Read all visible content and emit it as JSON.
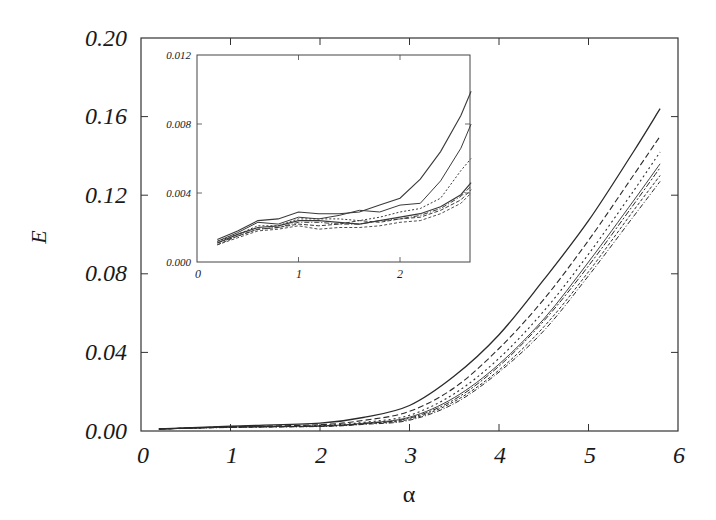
{
  "chart_data": [
    {
      "type": "line",
      "title": "",
      "xlabel": "α",
      "ylabel": "E",
      "xlim": [
        0,
        6
      ],
      "ylim": [
        0,
        0.2
      ],
      "xticks": [
        "0",
        "1",
        "2",
        "3",
        "4",
        "5",
        "6"
      ],
      "yticks": [
        "0.00",
        "0.04",
        "0.08",
        "0.12",
        "0.16",
        "0.20"
      ],
      "grid": false,
      "legend": null,
      "x": [
        0.2,
        1.0,
        2.0,
        2.5,
        3.0,
        3.5,
        4.0,
        4.5,
        5.0,
        5.5,
        5.8
      ],
      "series": [
        {
          "name": "curve-1 (solid)",
          "style": "solid",
          "values": [
            0.001,
            0.0025,
            0.004,
            0.007,
            0.013,
            0.028,
            0.049,
            0.077,
            0.107,
            0.142,
            0.164
          ]
        },
        {
          "name": "curve-2 (dashed)",
          "style": "dashed",
          "values": [
            0.001,
            0.0022,
            0.0032,
            0.0055,
            0.01,
            0.022,
            0.042,
            0.067,
            0.097,
            0.13,
            0.15
          ]
        },
        {
          "name": "curve-3 (dotted)",
          "style": "dotted",
          "values": [
            0.001,
            0.0021,
            0.0028,
            0.0045,
            0.008,
            0.019,
            0.037,
            0.061,
            0.09,
            0.122,
            0.142
          ]
        },
        {
          "name": "curve-4 (solid thin)",
          "style": "solid",
          "values": [
            0.001,
            0.002,
            0.0026,
            0.004,
            0.007,
            0.017,
            0.034,
            0.057,
            0.086,
            0.117,
            0.136
          ]
        },
        {
          "name": "curve-5 (dash-dot)",
          "style": "dashdot",
          "values": [
            0.001,
            0.002,
            0.0025,
            0.0038,
            0.0065,
            0.016,
            0.033,
            0.056,
            0.084,
            0.115,
            0.134
          ]
        },
        {
          "name": "curve-6 (dashed fine)",
          "style": "dashed",
          "values": [
            0.001,
            0.0019,
            0.0024,
            0.0036,
            0.006,
            0.015,
            0.031,
            0.053,
            0.081,
            0.112,
            0.13
          ]
        },
        {
          "name": "curve-7 (dash-dot)",
          "style": "dashdot",
          "values": [
            0.001,
            0.0018,
            0.0023,
            0.0034,
            0.0055,
            0.014,
            0.03,
            0.051,
            0.079,
            0.109,
            0.127
          ]
        }
      ]
    },
    {
      "type": "line",
      "title": "inset",
      "xlabel": "",
      "ylabel": "",
      "xlim": [
        0,
        2.7
      ],
      "ylim": [
        0,
        0.012
      ],
      "xticks": [
        "0",
        "1",
        "2"
      ],
      "yticks": [
        "0.000",
        "0.004",
        "0.008",
        "0.012"
      ],
      "grid": false,
      "x": [
        0.2,
        0.4,
        0.6,
        0.8,
        1.0,
        1.2,
        1.4,
        1.6,
        1.8,
        2.0,
        2.2,
        2.4,
        2.6,
        2.7
      ],
      "series": [
        {
          "name": "curve-1 (solid)",
          "style": "solid",
          "values": [
            0.0013,
            0.0018,
            0.0024,
            0.0025,
            0.0029,
            0.0028,
            0.0028,
            0.0029,
            0.0033,
            0.0037,
            0.0048,
            0.0064,
            0.0085,
            0.0099
          ]
        },
        {
          "name": "curve-2 (solid)",
          "style": "solid",
          "values": [
            0.0012,
            0.0017,
            0.0023,
            0.0022,
            0.0026,
            0.0025,
            0.0027,
            0.003,
            0.0029,
            0.0033,
            0.0034,
            0.0047,
            0.0066,
            0.008
          ]
        },
        {
          "name": "curve-3 (dotted)",
          "style": "dotted",
          "values": [
            0.0012,
            0.0016,
            0.0021,
            0.0021,
            0.0025,
            0.0025,
            0.0025,
            0.0024,
            0.0026,
            0.0029,
            0.0031,
            0.0037,
            0.0053,
            0.006
          ]
        },
        {
          "name": "curve-4 (solid dark)",
          "style": "solid",
          "values": [
            0.0011,
            0.0016,
            0.002,
            0.0021,
            0.0024,
            0.0024,
            0.0023,
            0.0022,
            0.0024,
            0.0026,
            0.0028,
            0.0032,
            0.0039,
            0.0046
          ]
        },
        {
          "name": "curve-5 (dash-dot)",
          "style": "dashdot",
          "values": [
            0.0011,
            0.0015,
            0.0019,
            0.002,
            0.0023,
            0.0023,
            0.0022,
            0.0022,
            0.0024,
            0.0025,
            0.0027,
            0.0031,
            0.0038,
            0.0044
          ]
        },
        {
          "name": "curve-6 (dashed)",
          "style": "dashed",
          "values": [
            0.001,
            0.0015,
            0.0019,
            0.002,
            0.0022,
            0.0021,
            0.0022,
            0.0024,
            0.0023,
            0.0025,
            0.0026,
            0.003,
            0.0036,
            0.0042
          ]
        },
        {
          "name": "curve-7 (dashed fine)",
          "style": "dashed",
          "values": [
            0.001,
            0.0014,
            0.0018,
            0.0019,
            0.0021,
            0.0019,
            0.002,
            0.002,
            0.0021,
            0.0023,
            0.0024,
            0.0028,
            0.0034,
            0.004
          ]
        }
      ]
    }
  ],
  "main": {
    "xlabel": "α",
    "ylabel": "E",
    "xticks": [
      "0",
      "1",
      "2",
      "3",
      "4",
      "5",
      "6"
    ],
    "yticks": [
      "0.00",
      "0.04",
      "0.08",
      "0.12",
      "0.16",
      "0.20"
    ]
  },
  "inset": {
    "xticks": [
      "0",
      "1",
      "2"
    ],
    "yticks": [
      "0.000",
      "0.004",
      "0.008",
      "0.012"
    ]
  },
  "colors": {
    "line": "#2a2a2a",
    "axis": "#333333",
    "background": "#ffffff"
  }
}
